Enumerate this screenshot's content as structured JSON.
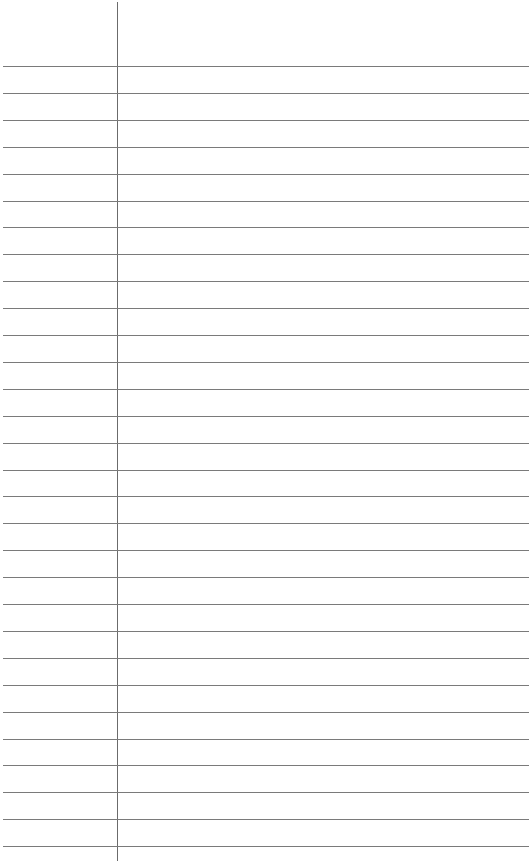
{
  "paper": {
    "type": "lined-notebook-page",
    "line_count": 30,
    "first_line_y": 66,
    "line_spacing": 26.9,
    "margin_line_x": 117,
    "colors": {
      "background": "#ffffff",
      "rule_line": "#7a7a7a",
      "margin_line": "#6b6b6b"
    }
  }
}
